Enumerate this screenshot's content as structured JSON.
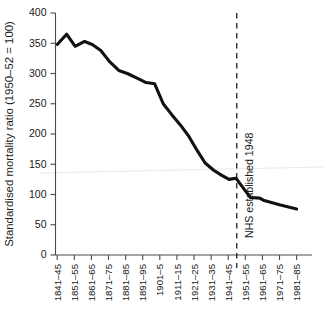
{
  "chart_data": {
    "type": "line",
    "title": "",
    "xlabel": "",
    "ylabel": "Standardised mortality ratio (1950–52 = 100)",
    "categories": [
      "1841–45",
      "1851–55",
      "1861–65",
      "1871–75",
      "1881–85",
      "1891–95",
      "1901–5",
      "1911–15",
      "1921–25",
      "1931–35",
      "1941–45",
      "1951–55",
      "1961–65",
      "1971–75",
      "1981–85"
    ],
    "values": [
      348,
      365,
      345,
      353,
      338,
      320,
      300,
      285,
      215,
      152,
      125,
      95,
      90,
      83,
      76
    ],
    "series": [
      {
        "name": "Standardised mortality ratio",
        "values": [
          348,
          365,
          345,
          353,
          338,
          320,
          300,
          285,
          215,
          152,
          125,
          95,
          90,
          83,
          76
        ]
      }
    ],
    "detail_points": [
      {
        "x": 0.0,
        "y": 348
      },
      {
        "x": 0.55,
        "y": 365
      },
      {
        "x": 1.05,
        "y": 345
      },
      {
        "x": 1.6,
        "y": 353
      },
      {
        "x": 2.05,
        "y": 348
      },
      {
        "x": 2.55,
        "y": 338
      },
      {
        "x": 3.05,
        "y": 320
      },
      {
        "x": 3.6,
        "y": 305
      },
      {
        "x": 4.1,
        "y": 300
      },
      {
        "x": 4.7,
        "y": 292
      },
      {
        "x": 5.2,
        "y": 285
      },
      {
        "x": 5.7,
        "y": 283
      },
      {
        "x": 6.2,
        "y": 250
      },
      {
        "x": 6.7,
        "y": 232
      },
      {
        "x": 7.2,
        "y": 215
      },
      {
        "x": 7.7,
        "y": 196
      },
      {
        "x": 8.2,
        "y": 172
      },
      {
        "x": 8.65,
        "y": 152
      },
      {
        "x": 9.15,
        "y": 140
      },
      {
        "x": 9.6,
        "y": 132
      },
      {
        "x": 10.05,
        "y": 125
      },
      {
        "x": 10.45,
        "y": 127
      },
      {
        "x": 10.95,
        "y": 108
      },
      {
        "x": 11.3,
        "y": 95
      },
      {
        "x": 11.85,
        "y": 94
      },
      {
        "x": 12.1,
        "y": 90
      },
      {
        "x": 13.0,
        "y": 83
      },
      {
        "x": 14.0,
        "y": 76
      }
    ],
    "yticks": [
      0,
      50,
      100,
      150,
      200,
      250,
      300,
      350,
      400
    ],
    "ylim": [
      0,
      400
    ],
    "grid": false,
    "legend": "none",
    "annotations": [
      {
        "id": "nhs-event",
        "text": "NHS established 1948",
        "type": "vertical-dashed-line",
        "x_position_between": [
          "1941–45",
          "1951–55"
        ],
        "orientation": "rotated-90"
      }
    ],
    "colors": {
      "line": "#111111",
      "axis": "#4a4a4a",
      "text": "#1a1a1a",
      "background": "#ffffff",
      "event_line": "#1a1a1a"
    }
  }
}
